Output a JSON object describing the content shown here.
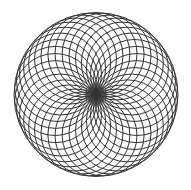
{
  "figure": {
    "type": "rosette",
    "background_color": "#ffffff",
    "stroke_color": "#333333",
    "stroke_width": 1,
    "center": [
      96,
      94.5
    ],
    "circle_radius": 41,
    "circle_count": 36
  }
}
